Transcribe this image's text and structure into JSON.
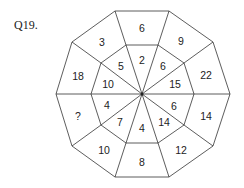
{
  "question": {
    "label": "Q19."
  },
  "puzzle": {
    "outer_ring": [
      "6",
      "9",
      "22",
      "14",
      "12",
      "8",
      "10",
      "?",
      "18",
      "3"
    ],
    "inner_ring": [
      "2",
      "6",
      "15",
      "6",
      "14",
      "4",
      "7",
      "4",
      "10",
      "5"
    ],
    "line_color": "#333333"
  }
}
